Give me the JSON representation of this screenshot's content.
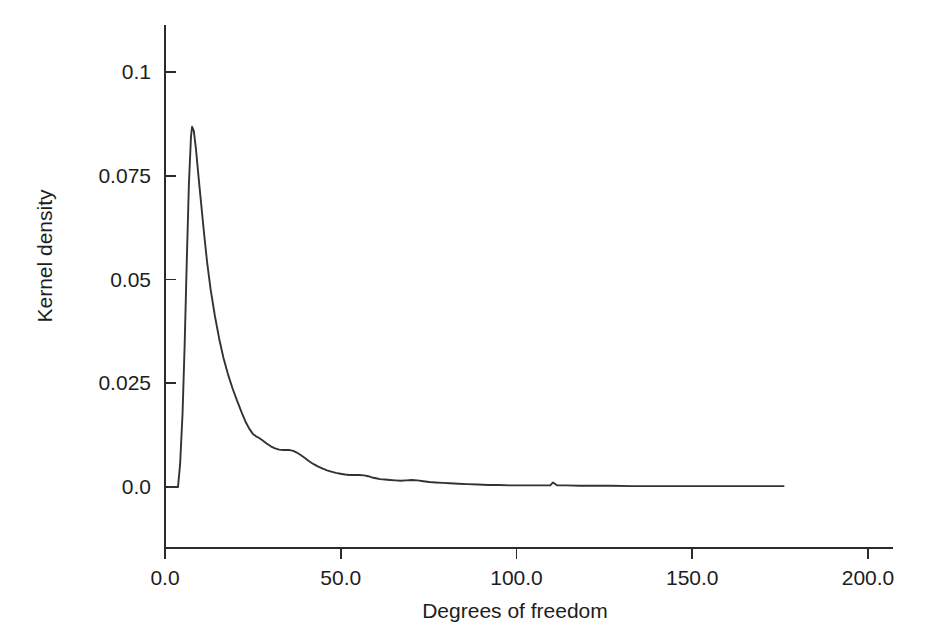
{
  "figure": {
    "width": 929,
    "height": 642,
    "background_color": "#ffffff",
    "line_color": "#333333",
    "axis_color": "#2b2b2b",
    "text_color": "#1d1d1d"
  },
  "chart_data": {
    "type": "line",
    "title": "",
    "subtitle": "",
    "xlabel": "Degrees of freedom",
    "ylabel": "Kernel density",
    "xlim": [
      0.0,
      200.0
    ],
    "ylim": [
      0.0,
      0.1125
    ],
    "xticks": [
      0.0,
      50.0,
      100.0,
      150.0,
      200.0
    ],
    "xtick_labels": [
      "0.0",
      "50.0",
      "100.0",
      "150.0",
      "200.0"
    ],
    "yticks": [
      0.0,
      0.025,
      0.05,
      0.075,
      0.1
    ],
    "ytick_labels": [
      "0.0",
      "0.025",
      "0.05",
      "0.075",
      "0.1"
    ],
    "grid": false,
    "legend": null,
    "legend_position": "none",
    "annotations": [],
    "series": [
      {
        "name": "Kernel density of degrees of freedom",
        "x": [
          0.9,
          3.7,
          4.3,
          5.0,
          5.6,
          6.2,
          6.8,
          7.4,
          7.7,
          8.2,
          8.8,
          9.4,
          10.2,
          11.1,
          12.0,
          13.0,
          14.2,
          15.4,
          16.6,
          17.9,
          19.2,
          20.5,
          21.8,
          23.0,
          24.0,
          25.0,
          25.9,
          26.8,
          27.8,
          28.9,
          30.1,
          31.3,
          32.5,
          33.6,
          34.6,
          35.5,
          36.5,
          37.5,
          38.6,
          39.8,
          41.0,
          42.3,
          43.6,
          44.9,
          46.1,
          47.3,
          48.6,
          49.9,
          51.2,
          52.5,
          53.9,
          55.3,
          56.6,
          57.8,
          58.9,
          60.0,
          61.2,
          62.6,
          64.0,
          65.5,
          67.0,
          68.6,
          70.2,
          71.8,
          73.5,
          75.2,
          77.0,
          79.0,
          81.0,
          83.5,
          86.0,
          89.0,
          92.0,
          95.0,
          98.0,
          101.0,
          104.0,
          107.0,
          109.6,
          110.4,
          111.5,
          114.0,
          118.0,
          122.0,
          127.0,
          133.0,
          140.0,
          148.0,
          157.0,
          166.0,
          172.0,
          176.2
        ],
        "y": [
          0.0,
          0.0,
          0.0055,
          0.0178,
          0.0345,
          0.0545,
          0.073,
          0.0845,
          0.0868,
          0.0858,
          0.0815,
          0.076,
          0.069,
          0.0612,
          0.054,
          0.0475,
          0.0412,
          0.0358,
          0.0312,
          0.0272,
          0.0238,
          0.0208,
          0.018,
          0.0156,
          0.014,
          0.0128,
          0.0122,
          0.0118,
          0.0112,
          0.0105,
          0.0098,
          0.0093,
          0.009,
          0.0089,
          0.0089,
          0.0089,
          0.0087,
          0.0083,
          0.0077,
          0.007,
          0.0062,
          0.0055,
          0.0049,
          0.0044,
          0.004,
          0.0037,
          0.0034,
          0.0032,
          0.003,
          0.0029,
          0.0029,
          0.0029,
          0.0028,
          0.0026,
          0.0023,
          0.0021,
          0.0019,
          0.0018,
          0.0017,
          0.0016,
          0.0015,
          0.0016,
          0.0017,
          0.0016,
          0.0014,
          0.0012,
          0.0011,
          0.001,
          0.0009,
          0.0008,
          0.0007,
          0.0006,
          0.0005,
          0.0005,
          0.0004,
          0.0004,
          0.0004,
          0.0004,
          0.0004,
          0.0011,
          0.0004,
          0.0004,
          0.0003,
          0.0003,
          0.0003,
          0.0002,
          0.0002,
          0.0002,
          0.0002,
          0.0002,
          0.0002,
          0.0002
        ]
      }
    ]
  }
}
